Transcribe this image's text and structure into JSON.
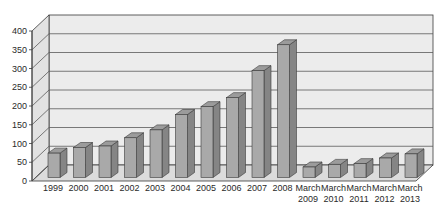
{
  "chart_data": {
    "type": "bar",
    "style": "3d-column",
    "title": "",
    "xlabel": "",
    "ylabel": "",
    "categories": [
      "1999",
      "2000",
      "2001",
      "2002",
      "2003",
      "2004",
      "2005",
      "2006",
      "2007",
      "2008",
      "March 2009",
      "March 2010",
      "March 2011",
      "March 2012",
      "March 2013"
    ],
    "values": [
      65,
      80,
      84,
      106,
      127,
      168,
      189,
      213,
      285,
      354,
      28,
      35,
      37,
      52,
      63
    ],
    "ylim": [
      0,
      400
    ],
    "yticks": [
      0,
      50,
      100,
      150,
      200,
      250,
      300,
      350,
      400
    ],
    "grid": true,
    "legend": null
  },
  "colors": {
    "bar_front": "#a9a9a9",
    "bar_side": "#858585",
    "bar_top": "#9b9b9b",
    "bar_edge": "#3a3a3a",
    "wall": "#ececec",
    "side_wall": "#e2e2e2",
    "floor": "#dcdcdc",
    "grid": "#5a5a5a",
    "axis": "#3a3a3a"
  }
}
